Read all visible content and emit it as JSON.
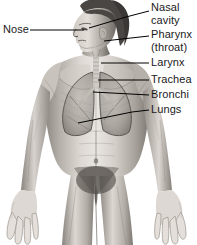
{
  "diagram": {
    "background_color": "#ffffff",
    "label_color": "#1a1a1a",
    "leader_line_color": "#000000",
    "labels": [
      {
        "id": "nose",
        "text": "Nose",
        "side": "left",
        "x": 5,
        "y": 24
      },
      {
        "id": "nasal-cavity-1",
        "text": "Nasal",
        "side": "right",
        "x": 151,
        "y": 3
      },
      {
        "id": "nasal-cavity-2",
        "text": "cavity",
        "side": "right",
        "x": 151,
        "y": 15
      },
      {
        "id": "pharynx-1",
        "text": "Pharynx",
        "side": "right",
        "x": 151,
        "y": 29
      },
      {
        "id": "pharynx-2",
        "text": "(throat)",
        "side": "right",
        "x": 151,
        "y": 42
      },
      {
        "id": "larynx",
        "text": "Larynx",
        "side": "right",
        "x": 151,
        "y": 57
      },
      {
        "id": "trachea",
        "text": "Trachea",
        "side": "right",
        "x": 151,
        "y": 74
      },
      {
        "id": "bronchi",
        "text": "Bronchi",
        "side": "right",
        "x": 151,
        "y": 89
      },
      {
        "id": "lungs",
        "text": "Lungs",
        "side": "right",
        "x": 151,
        "y": 104
      }
    ],
    "leaders": [
      {
        "id": "leader-nose",
        "points": "30,30 84,30"
      },
      {
        "id": "leader-nasal-cavity",
        "points": "89,28 126,17 149,11"
      },
      {
        "id": "leader-pharynx",
        "points": "104,41 149,36"
      },
      {
        "id": "leader-larynx",
        "points": "101,63 149,63"
      },
      {
        "id": "leader-trachea",
        "points": "98,80 149,80"
      },
      {
        "id": "leader-bronchi",
        "points": "93,92 149,95"
      },
      {
        "id": "leader-lungs",
        "points": "78,123 132,112 149,110"
      }
    ],
    "anatomy_colors": {
      "skin_light": "#e8e4e0",
      "skin_mid": "#b9b3ae",
      "skin_shadow": "#7d7874",
      "skin_deep": "#56524f",
      "hair_dark": "#4a4643",
      "lung_fill": "#9a958f",
      "lung_outline": "#5e5a56",
      "trachea": "#cfcac4"
    }
  }
}
